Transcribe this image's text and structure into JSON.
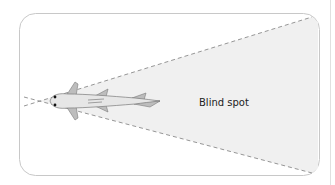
{
  "diagram": {
    "labels": {
      "blind_spot": "Blind spot"
    },
    "colors": {
      "frame": "#c8c8c8",
      "cone_fill": "#f0f0f0",
      "dash": "#8a8a8a",
      "fish_body": "#e6e6e6",
      "fish_outline": "#7a7a7a",
      "fin": "#bdbdbd"
    }
  }
}
